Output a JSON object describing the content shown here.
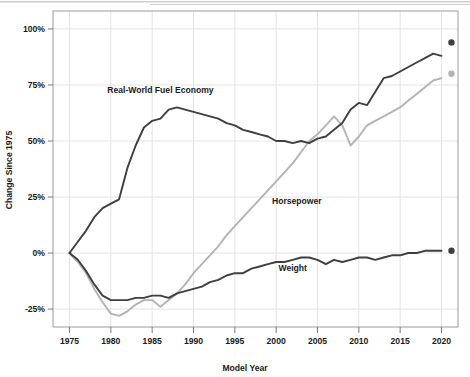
{
  "chart_data": {
    "type": "line",
    "title": "",
    "xlabel": "Model Year",
    "ylabel": "Change Since 1975",
    "xlim": [
      1973,
      2022
    ],
    "ylim": [
      -33,
      108
    ],
    "grid": true,
    "legend": "inline-labels",
    "x_ticks": [
      1975,
      1980,
      1985,
      1990,
      1995,
      2000,
      2005,
      2010,
      2015,
      2020
    ],
    "x_tick_labels": [
      "1975",
      "1980",
      "1985",
      "1990",
      "1995",
      "2000",
      "2005",
      "2010",
      "2015",
      "2020"
    ],
    "y_ticks": [
      -25,
      0,
      25,
      50,
      75,
      100
    ],
    "y_tick_labels": [
      "-25%",
      "0%",
      "25%",
      "50%",
      "75%",
      "100%"
    ],
    "series": [
      {
        "name": "Real-World Fuel Economy",
        "color": "#3f3f3f",
        "label_x": 1986.0,
        "label_y": 71.5,
        "endpoint": {
          "x": 2020,
          "y": 94,
          "color": "#3f3f3f"
        },
        "x": [
          1975,
          1976,
          1977,
          1978,
          1979,
          1980,
          1981,
          1982,
          1983,
          1984,
          1985,
          1986,
          1987,
          1988,
          1989,
          1990,
          1991,
          1992,
          1993,
          1994,
          1995,
          1996,
          1997,
          1998,
          1999,
          2000,
          2001,
          2002,
          2003,
          2004,
          2005,
          2006,
          2007,
          2008,
          2009,
          2010,
          2011,
          2012,
          2013,
          2014,
          2015,
          2016,
          2017,
          2018,
          2019,
          2020
        ],
        "y": [
          0,
          5,
          10,
          16,
          20,
          22,
          24,
          38,
          48,
          56,
          59,
          60,
          64,
          65,
          64,
          63,
          62,
          61,
          60,
          58,
          57,
          55,
          54,
          53,
          52,
          50,
          50,
          49,
          50,
          49,
          51,
          52,
          55,
          58,
          64,
          67,
          66,
          72,
          78,
          79,
          81,
          83,
          85,
          87,
          89,
          88
        ]
      },
      {
        "name": "Horsepower",
        "color": "#b3b3b3",
        "label_x": 2002.5,
        "label_y": 22.0,
        "endpoint": {
          "x": 2020,
          "y": 80,
          "color": "#b3b3b3"
        },
        "x": [
          1975,
          1976,
          1977,
          1978,
          1979,
          1980,
          1981,
          1982,
          1983,
          1984,
          1985,
          1986,
          1987,
          1988,
          1989,
          1990,
          1991,
          1992,
          1993,
          1994,
          1995,
          1996,
          1997,
          1998,
          1999,
          2000,
          2001,
          2002,
          2003,
          2004,
          2005,
          2006,
          2007,
          2008,
          2009,
          2010,
          2011,
          2012,
          2013,
          2014,
          2015,
          2016,
          2017,
          2018,
          2019,
          2020
        ],
        "y": [
          0,
          -4,
          -9,
          -16,
          -22,
          -27,
          -28,
          -26,
          -23,
          -21,
          -21,
          -24,
          -21,
          -18,
          -14,
          -9,
          -5,
          -1,
          3,
          8,
          12,
          16,
          20,
          24,
          28,
          32,
          36,
          40,
          45,
          50,
          53,
          57,
          61,
          57,
          48,
          52,
          57,
          59,
          61,
          63,
          65,
          68,
          71,
          74,
          77,
          78
        ]
      },
      {
        "name": "Weight",
        "color": "#3f3f3f",
        "label_x": 2002.0,
        "label_y": -8.0,
        "endpoint": {
          "x": 2020,
          "y": 1,
          "color": "#3f3f3f"
        },
        "x": [
          1975,
          1976,
          1977,
          1978,
          1979,
          1980,
          1981,
          1982,
          1983,
          1984,
          1985,
          1986,
          1987,
          1988,
          1989,
          1990,
          1991,
          1992,
          1993,
          1994,
          1995,
          1996,
          1997,
          1998,
          1999,
          2000,
          2001,
          2002,
          2003,
          2004,
          2005,
          2006,
          2007,
          2008,
          2009,
          2010,
          2011,
          2012,
          2013,
          2014,
          2015,
          2016,
          2017,
          2018,
          2019,
          2020
        ],
        "y": [
          0,
          -3,
          -8,
          -14,
          -19,
          -21,
          -21,
          -21,
          -20,
          -20,
          -19,
          -19,
          -20,
          -18,
          -17,
          -16,
          -15,
          -13,
          -12,
          -10,
          -9,
          -9,
          -7,
          -6,
          -5,
          -4,
          -4,
          -3,
          -2,
          -2,
          -3,
          -5,
          -3,
          -4,
          -3,
          -2,
          -2,
          -3,
          -2,
          -1,
          -1,
          0,
          0,
          1,
          1,
          1
        ]
      }
    ]
  },
  "plot": {
    "axis_y_title": "Change Since 1975",
    "axis_x_title": "Model Year"
  }
}
